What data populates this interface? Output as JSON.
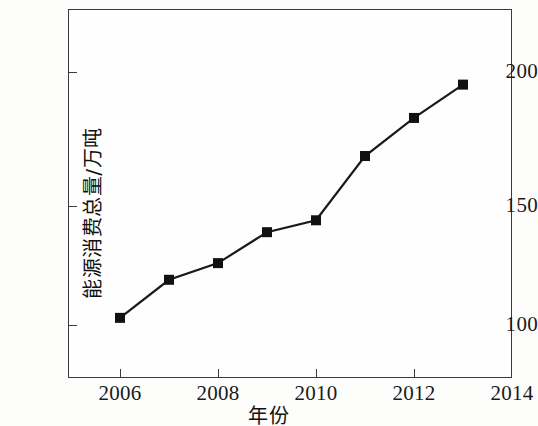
{
  "chart_data": {
    "type": "line",
    "title": "",
    "xlabel": "年份",
    "ylabel": "能源消费总量/万吨",
    "x": [
      2006,
      2007,
      2008,
      2009,
      2010,
      2011,
      2012,
      2013
    ],
    "values": [
      103,
      119,
      126,
      139,
      144,
      171,
      187,
      201
    ],
    "series": [
      {
        "name": "能源消费总量",
        "values": [
          103,
          119,
          126,
          139,
          144,
          171,
          187,
          201
        ]
      }
    ],
    "xlim": [
      2005,
      2014
    ],
    "ylim": [
      85,
      215
    ],
    "xticks": [
      2006,
      2008,
      2010,
      2012,
      2014
    ],
    "xtick_labels": [
      "2006",
      "2008",
      "2010",
      "2012",
      "2014"
    ],
    "yticks": [
      100,
      150,
      200
    ],
    "ytick_labels": [
      "100",
      "150",
      "200"
    ],
    "grid": false,
    "legend": false,
    "marker": "square",
    "marker_color": "#111111",
    "line_color": "#1a1a1a",
    "background_color": "#fefefe",
    "frame_color": "#3a3a3a"
  }
}
